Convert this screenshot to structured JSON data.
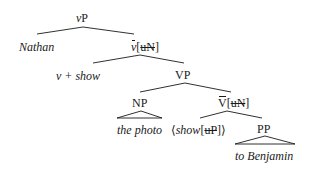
{
  "diagram": {
    "type": "syntax-tree",
    "nodes": {
      "root": {
        "cat": "v",
        "suffix": "P"
      },
      "spec": {
        "text": "Nathan"
      },
      "vbar": {
        "cat": "v",
        "open": "[",
        "feature": "uN",
        "close": "]"
      },
      "vhead": {
        "text": "v + show"
      },
      "vp": {
        "text": "VP"
      },
      "np": {
        "text": "NP"
      },
      "np_content": {
        "text": "the photo"
      },
      "Vbar": {
        "cat": "V",
        "open": "[",
        "feature": "uN",
        "close": "]"
      },
      "Vhead": {
        "open": "⟨",
        "word": "show",
        "fopen": "[",
        "feature": "uP",
        "fclose": "]",
        "close": "⟩"
      },
      "pp": {
        "text": "PP"
      },
      "pp_content": {
        "text": "to Benjamin"
      }
    },
    "line_color": "#1a1a1a"
  }
}
